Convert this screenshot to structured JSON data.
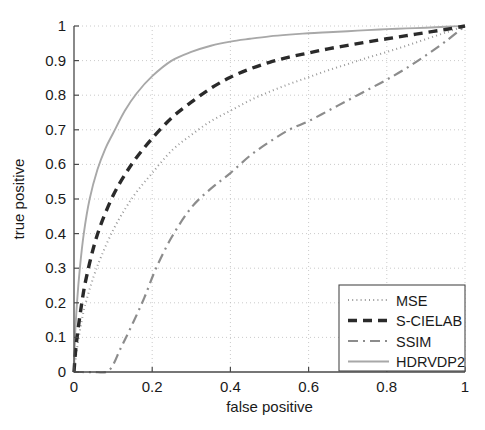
{
  "chart_data": {
    "type": "line",
    "title": "",
    "xlabel": "false positive",
    "ylabel": "true positive",
    "xlim": [
      0,
      1
    ],
    "ylim": [
      0,
      1
    ],
    "grid": true,
    "legend_position": "bottom-right",
    "x_ticks": [
      "0",
      "0.2",
      "0.4",
      "0.6",
      "0.8",
      "1"
    ],
    "x_tick_values": [
      0,
      0.2,
      0.4,
      0.6,
      0.8,
      1
    ],
    "y_ticks": [
      "0",
      "0.1",
      "0.2",
      "0.3",
      "0.4",
      "0.5",
      "0.6",
      "0.7",
      "0.8",
      "0.9",
      "1"
    ],
    "y_tick_values": [
      0,
      0.1,
      0.2,
      0.3,
      0.4,
      0.5,
      0.6,
      0.7,
      0.8,
      0.9,
      1
    ],
    "series": [
      {
        "name": "MSE",
        "style": "dotted",
        "color": "#9a9a9a",
        "width": 2.0,
        "dash": "1,3.2",
        "x": [
          0,
          0.005,
          0.01,
          0.02,
          0.03,
          0.05,
          0.07,
          0.1,
          0.13,
          0.16,
          0.2,
          0.25,
          0.3,
          0.35,
          0.4,
          0.45,
          0.5,
          0.55,
          0.6,
          0.65,
          0.7,
          0.75,
          0.8,
          0.85,
          0.9,
          0.95,
          1
        ],
        "y": [
          0,
          0.045,
          0.085,
          0.15,
          0.2,
          0.275,
          0.335,
          0.41,
          0.47,
          0.52,
          0.575,
          0.64,
          0.685,
          0.725,
          0.755,
          0.785,
          0.81,
          0.832,
          0.852,
          0.872,
          0.89,
          0.908,
          0.925,
          0.943,
          0.962,
          0.981,
          1
        ]
      },
      {
        "name": "S-CIELAB",
        "style": "dashed",
        "color": "#2a2a2a",
        "width": 3.4,
        "dash": "9,6",
        "x": [
          0,
          0.004,
          0.01,
          0.02,
          0.03,
          0.05,
          0.07,
          0.1,
          0.13,
          0.16,
          0.2,
          0.25,
          0.3,
          0.35,
          0.4,
          0.45,
          0.5,
          0.55,
          0.6,
          0.65,
          0.7,
          0.75,
          0.8,
          0.85,
          0.9,
          0.95,
          1
        ],
        "y": [
          0,
          0.06,
          0.12,
          0.2,
          0.265,
          0.36,
          0.43,
          0.51,
          0.57,
          0.62,
          0.675,
          0.735,
          0.78,
          0.82,
          0.852,
          0.876,
          0.895,
          0.91,
          0.922,
          0.934,
          0.944,
          0.954,
          0.963,
          0.972,
          0.981,
          0.99,
          1
        ]
      },
      {
        "name": "SSIM",
        "style": "dashdot",
        "color": "#8c8c8c",
        "width": 2.2,
        "dash": "10,5,2,5",
        "x": [
          0,
          0.02,
          0.05,
          0.09,
          0.12,
          0.15,
          0.18,
          0.21,
          0.25,
          0.3,
          0.35,
          0.4,
          0.45,
          0.5,
          0.55,
          0.6,
          0.65,
          0.7,
          0.75,
          0.8,
          0.85,
          0.9,
          0.95,
          1
        ],
        "y": [
          0,
          0,
          0,
          0.005,
          0.07,
          0.14,
          0.215,
          0.3,
          0.39,
          0.475,
          0.53,
          0.575,
          0.625,
          0.665,
          0.7,
          0.725,
          0.755,
          0.785,
          0.815,
          0.845,
          0.878,
          0.915,
          0.955,
          1
        ]
      },
      {
        "name": "HDRVDP2",
        "style": "solid",
        "color": "#a8a8a8",
        "width": 1.9,
        "dash": "",
        "x": [
          0,
          0.003,
          0.008,
          0.015,
          0.025,
          0.04,
          0.06,
          0.08,
          0.1,
          0.13,
          0.16,
          0.2,
          0.25,
          0.3,
          0.35,
          0.4,
          0.45,
          0.5,
          0.55,
          0.6,
          0.65,
          0.7,
          0.75,
          0.8,
          0.85,
          0.9,
          0.95,
          1
        ],
        "y": [
          0,
          0.11,
          0.205,
          0.3,
          0.4,
          0.5,
          0.585,
          0.645,
          0.69,
          0.755,
          0.805,
          0.855,
          0.9,
          0.925,
          0.943,
          0.955,
          0.963,
          0.97,
          0.975,
          0.979,
          0.982,
          0.985,
          0.988,
          0.991,
          0.993,
          0.995,
          0.998,
          1
        ]
      }
    ]
  },
  "legend": {
    "entries": [
      {
        "label": "MSE"
      },
      {
        "label": "S-CIELAB"
      },
      {
        "label": "SSIM"
      },
      {
        "label": "HDRVDP2"
      }
    ]
  }
}
